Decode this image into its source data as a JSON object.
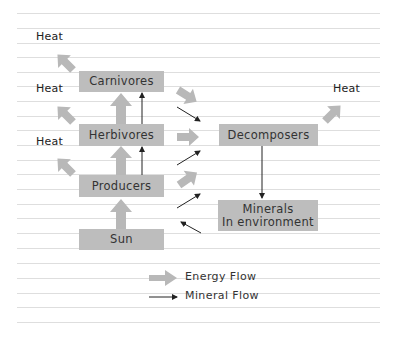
{
  "diagram": {
    "type": "energy-and-mineral-flow",
    "nodes": {
      "carnivores": "Carnivores",
      "herbivores": "Herbivores",
      "producers": "Producers",
      "sun": "Sun",
      "decomposers": "Decomposers",
      "minerals_line1": "Minerals",
      "minerals_line2": "In environment"
    },
    "heat_labels": {
      "carnivores": "Heat",
      "herbivores": "Heat",
      "producers": "Heat",
      "decomposers": "Heat"
    },
    "edges": [
      {
        "from": "Sun",
        "to": "Producers",
        "kind": "energy"
      },
      {
        "from": "Producers",
        "to": "Herbivores",
        "kind": "energy"
      },
      {
        "from": "Herbivores",
        "to": "Carnivores",
        "kind": "energy"
      },
      {
        "from": "Producers",
        "to": "Herbivores",
        "kind": "mineral"
      },
      {
        "from": "Herbivores",
        "to": "Carnivores",
        "kind": "mineral"
      },
      {
        "from": "Carnivores",
        "to": "Decomposers",
        "kind": "energy"
      },
      {
        "from": "Herbivores",
        "to": "Decomposers",
        "kind": "energy"
      },
      {
        "from": "Producers",
        "to": "Decomposers",
        "kind": "energy"
      },
      {
        "from": "Carnivores",
        "to": "Decomposers",
        "kind": "mineral"
      },
      {
        "from": "Herbivores",
        "to": "Decomposers",
        "kind": "mineral"
      },
      {
        "from": "Producers",
        "to": "Decomposers",
        "kind": "mineral"
      },
      {
        "from": "Decomposers",
        "to": "Minerals in environment",
        "kind": "mineral"
      },
      {
        "from": "Minerals in environment",
        "to": "Producers",
        "kind": "mineral"
      },
      {
        "from": "Carnivores",
        "to": "Heat",
        "kind": "energy"
      },
      {
        "from": "Herbivores",
        "to": "Heat",
        "kind": "energy"
      },
      {
        "from": "Producers",
        "to": "Heat",
        "kind": "energy"
      },
      {
        "from": "Decomposers",
        "to": "Heat",
        "kind": "energy"
      }
    ],
    "legend": {
      "energy": "Energy Flow",
      "mineral": "Mineral Flow"
    },
    "colors": {
      "box": "#bdbdbd",
      "energy_arrow": "#b8b8b8",
      "mineral_arrow": "#222222",
      "ruled_line": "#dcdcdc"
    }
  }
}
